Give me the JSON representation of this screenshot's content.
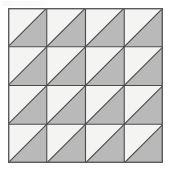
{
  "figure": {
    "name": "triangle-tiling-grid",
    "description": "Square grid of identical half-shaded square tiles",
    "rows": 4,
    "columns": 4,
    "cell_count": 16,
    "diagonal_direction": "bottom-left-to-top-right",
    "shaded_half": "lower-right",
    "unshaded_half": "upper-left",
    "origin_x": 8,
    "origin_y": 8,
    "grid_width": 155,
    "grid_height": 155,
    "cell_size": 38.5,
    "colors": {
      "shaded_fill": "#b9b9b9",
      "unshaded_fill": "#f4f4f3",
      "grid_line": "#4a4a4a",
      "diagonal_line": "#4a4a4a",
      "outer_border": "#5a5a5a",
      "page_background": "#ffffff"
    },
    "stroke_widths": {
      "outer_border": 1.4,
      "grid_line": 1.1,
      "diagonal_line": 1.1
    },
    "cells": [
      {
        "row": 0,
        "col": 0,
        "shaded": "lower-right"
      },
      {
        "row": 0,
        "col": 1,
        "shaded": "lower-right"
      },
      {
        "row": 0,
        "col": 2,
        "shaded": "lower-right"
      },
      {
        "row": 0,
        "col": 3,
        "shaded": "lower-right"
      },
      {
        "row": 1,
        "col": 0,
        "shaded": "lower-right"
      },
      {
        "row": 1,
        "col": 1,
        "shaded": "lower-right"
      },
      {
        "row": 1,
        "col": 2,
        "shaded": "lower-right"
      },
      {
        "row": 1,
        "col": 3,
        "shaded": "lower-right"
      },
      {
        "row": 2,
        "col": 0,
        "shaded": "lower-right"
      },
      {
        "row": 2,
        "col": 1,
        "shaded": "lower-right"
      },
      {
        "row": 2,
        "col": 2,
        "shaded": "lower-right"
      },
      {
        "row": 2,
        "col": 3,
        "shaded": "lower-right"
      },
      {
        "row": 3,
        "col": 0,
        "shaded": "lower-right"
      },
      {
        "row": 3,
        "col": 1,
        "shaded": "lower-right"
      },
      {
        "row": 3,
        "col": 2,
        "shaded": "lower-right"
      },
      {
        "row": 3,
        "col": 3,
        "shaded": "lower-right"
      }
    ]
  }
}
